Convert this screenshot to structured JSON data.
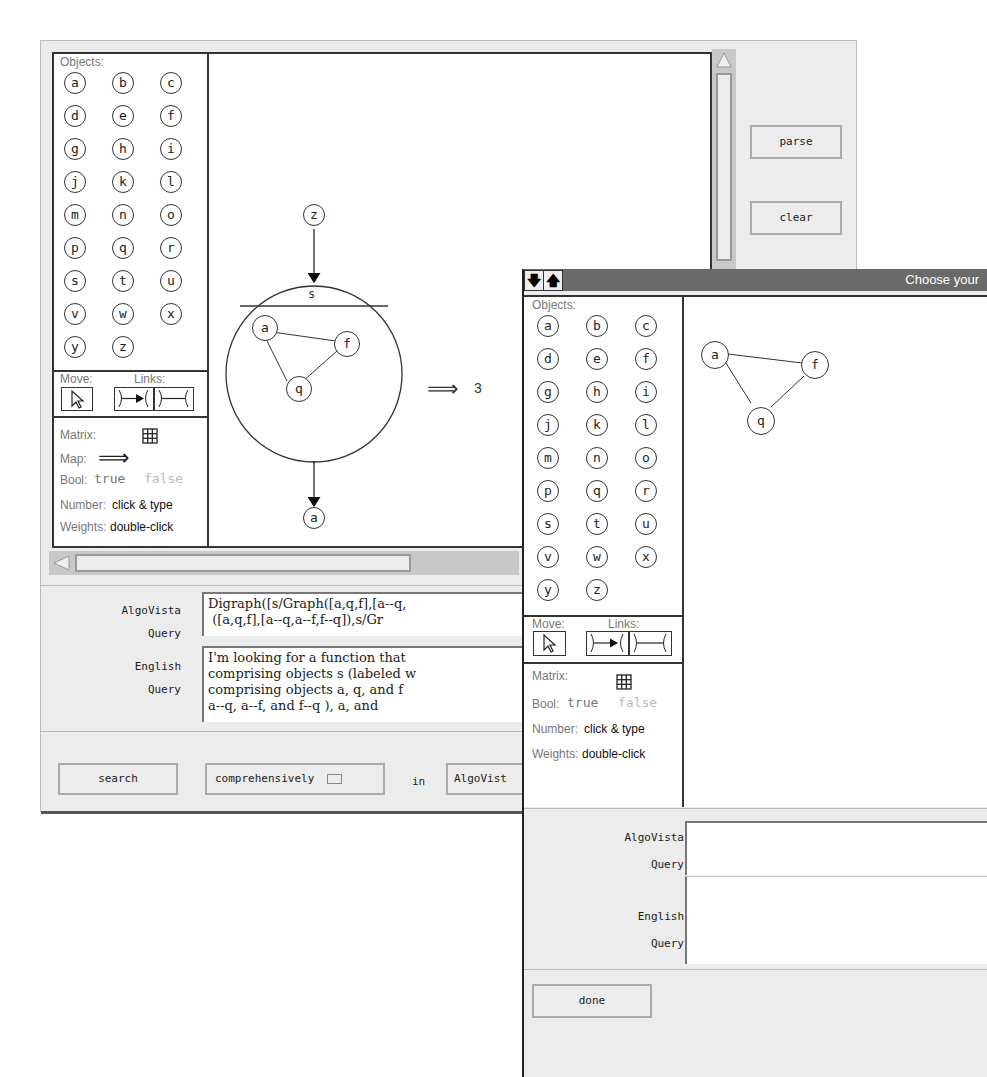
{
  "window_main": {
    "palette": {
      "objects_label": "Objects:",
      "objects": [
        "a",
        "b",
        "c",
        "d",
        "e",
        "f",
        "g",
        "h",
        "i",
        "j",
        "k",
        "l",
        "m",
        "n",
        "o",
        "p",
        "q",
        "r",
        "s",
        "t",
        "u",
        "v",
        "w",
        "x",
        "y",
        "z"
      ],
      "move_label": "Move:",
      "links_label": "Links:",
      "matrix_label": "Matrix:",
      "map_label": "Map:",
      "map_symbol": "⟹",
      "bool_label": "Bool:",
      "bool_true": "true",
      "bool_false": "false",
      "number_label": "Number:",
      "number_hint": "click & type",
      "weights_label": "Weights:",
      "weights_hint": "double-click"
    },
    "canvas": {
      "top_node": "z",
      "group_label": "s",
      "inner_nodes": [
        "a",
        "f",
        "q"
      ],
      "bottom_node": "a",
      "map_arrow": "⟹",
      "result": "3"
    },
    "buttons": {
      "parse": "parse",
      "clear": "clear",
      "search": "search",
      "mode": "comprehensively",
      "in_label": "in",
      "target": "AlgoVist"
    },
    "query": {
      "algovista_label_1": "AlgoVista",
      "algovista_label_2": "Query",
      "algovista_text": "Digraph([s/Graph([a,q,f],[a--q,\n ([a,q,f],[a--q,a--f,f--q]),s/Gr",
      "english_label_1": "English",
      "english_label_2": "Query",
      "english_text": "I'm looking for a function that\ncomprising objects s (labeled w\ncomprising objects a, q, and f \na--q, a--f, and f--q ), a, and "
    }
  },
  "window_dialog": {
    "title": "Choose your",
    "arrow_down": "🡇",
    "arrow_up": "🡅",
    "palette": {
      "objects_label": "Objects:",
      "objects": [
        "a",
        "b",
        "c",
        "d",
        "e",
        "f",
        "g",
        "h",
        "i",
        "j",
        "k",
        "l",
        "m",
        "n",
        "o",
        "p",
        "q",
        "r",
        "s",
        "t",
        "u",
        "v",
        "w",
        "x",
        "y",
        "z"
      ],
      "move_label": "Move:",
      "links_label": "Links:",
      "matrix_label": "Matrix:",
      "bool_label": "Bool:",
      "bool_true": "true",
      "bool_false": "false",
      "number_label": "Number:",
      "number_hint": "click & type",
      "weights_label": "Weights:",
      "weights_hint": "double-click"
    },
    "canvas": {
      "nodes": [
        "a",
        "f",
        "q"
      ]
    },
    "query": {
      "algovista_label_1": "AlgoVista",
      "algovista_label_2": "Query",
      "algovista_text": "",
      "english_label_1": "English",
      "english_label_2": "Query",
      "english_text": ""
    },
    "buttons": {
      "done": "done"
    }
  }
}
